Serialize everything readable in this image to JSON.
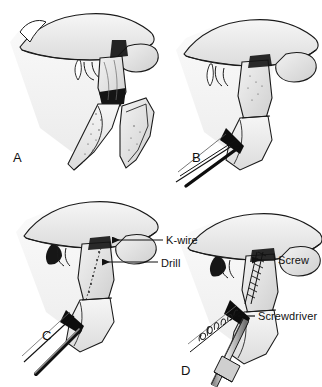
{
  "figure": {
    "background_color": "#ffffff",
    "ink_color": "#111111",
    "shade_light": "#efefef",
    "shade_mid": "#d8d8d8",
    "shade_dark": "#9a9a9a",
    "signature": "C. Machado"
  },
  "panels": [
    {
      "letter": "A",
      "name": "panel-a",
      "caption": "A",
      "description": "Displaced type II odontoid fracture, lateral view"
    },
    {
      "letter": "B",
      "name": "panel-b",
      "caption": "B",
      "description": "Fracture reduced with instrument in place"
    },
    {
      "letter": "C",
      "name": "panel-c",
      "caption": "C",
      "description": "K-wire and drill advanced across fracture line"
    },
    {
      "letter": "D",
      "name": "panel-d",
      "caption": "D",
      "description": "Screw inserted with screwdriver"
    }
  ],
  "callouts": [
    {
      "id": "kwire",
      "label": "K-wire",
      "panel": "C"
    },
    {
      "id": "drill",
      "label": "Drill",
      "panel": "C"
    },
    {
      "id": "screw",
      "label": "Screw",
      "panel": "D"
    },
    {
      "id": "screwdriver",
      "label": "Screwdriver",
      "panel": "D"
    }
  ]
}
